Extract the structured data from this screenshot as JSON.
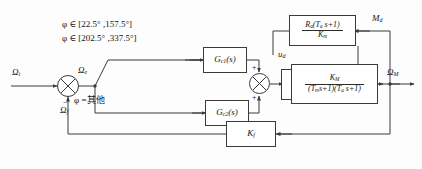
{
  "diagram": {
    "language": "zh-CN",
    "colors": {
      "line": "#3a3a3a",
      "text": "#151515",
      "background": "#fdfdfd"
    },
    "signals": {
      "input_ref": "Ω",
      "input_ref_sub": "i",
      "error": "Ω",
      "error_sub": "e",
      "feedback": "Ω",
      "feedback_sub": "f",
      "controller_out": "n",
      "controller_out_sub": "c",
      "amp_out": "u",
      "amp_out_sub": "a",
      "disturb_volt": "u",
      "disturb_volt_sub": "d",
      "load_torque": "M",
      "load_torque_sub": "d",
      "output": "Ω",
      "output_sub": "M"
    },
    "conditions": {
      "phase_range_1": "φ ∈ [22.5° ,157.5°]",
      "phase_range_2": "φ ∈ [202.5° ,337.5°]",
      "phase_other": "φ =其他"
    },
    "blocks": [
      {
        "id": "gc1",
        "name": "controller-1-block",
        "label": "G",
        "label_sub": "c1",
        "label_tail": "(s)"
      },
      {
        "id": "gc2",
        "name": "controller-2-block",
        "label": "G",
        "label_sub": "c2",
        "label_tail": "(s)"
      },
      {
        "id": "pwm",
        "name": "pwm-gain-block",
        "label_1": "K",
        "label_1_sub": "PWM",
        "label_2": "K",
        "label_2_sub": "P"
      },
      {
        "id": "armature",
        "name": "armature-impedance-block",
        "numerator": "R",
        "numerator_sub": "a",
        "numerator_tail": "(T",
        "numerator_sub2": "a",
        "numerator_tail2": " s+1)",
        "denominator": "K",
        "denominator_sub": "m"
      },
      {
        "id": "motor",
        "name": "motor-transfer-block",
        "numerator": "K",
        "numerator_sub": "M",
        "denominator_p1": "(T",
        "denominator_p1_sub": "m",
        "denominator_p2": "s+1)(T",
        "denominator_p2_sub": "a",
        "denominator_p3": " s+1)"
      },
      {
        "id": "kf",
        "name": "speed-feedback-gain-block",
        "label": "K",
        "label_sub": "f"
      }
    ],
    "sum_junctions": [
      {
        "id": "sum-error",
        "name": "error-summing-junction",
        "signs": {
          "bottom": "−"
        }
      },
      {
        "id": "sum-nc",
        "name": "controller-summing-junction",
        "signs": {
          "top": "+",
          "right": "+",
          "bottom": "+"
        }
      },
      {
        "id": "sum-ud",
        "name": "voltage-summing-junction",
        "signs": {
          "top": "−",
          "left": "+"
        }
      }
    ]
  }
}
